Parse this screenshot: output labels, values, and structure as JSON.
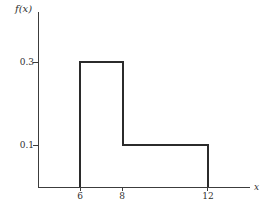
{
  "figure": {
    "background": "#ffffff",
    "axis_color": "#3c3c3c",
    "curve_color": "#2b2b2b"
  },
  "chart_data": {
    "type": "line",
    "subtype": "step-function-outline",
    "title": "",
    "xlabel": "x",
    "ylabel": "f(x)",
    "xlim": [
      4,
      14
    ],
    "ylim": [
      0,
      0.42
    ],
    "grid": false,
    "legend": false,
    "x_ticks": [
      {
        "value": 6,
        "label": "6"
      },
      {
        "value": 8,
        "label": "8"
      },
      {
        "value": 12,
        "label": "12"
      }
    ],
    "y_ticks": [
      {
        "value": 0.1,
        "label": "0.1"
      },
      {
        "value": 0.3,
        "label": "0.3"
      }
    ],
    "series": [
      {
        "name": "f(x)",
        "points": [
          [
            6,
            0
          ],
          [
            6,
            0.3
          ],
          [
            8,
            0.3
          ],
          [
            8,
            0.1
          ],
          [
            12,
            0.1
          ],
          [
            12,
            0
          ]
        ],
        "description": "f(x) = 0.3 for 6 <= x <= 8; f(x) = 0.1 for 8 < x <= 12"
      }
    ]
  }
}
